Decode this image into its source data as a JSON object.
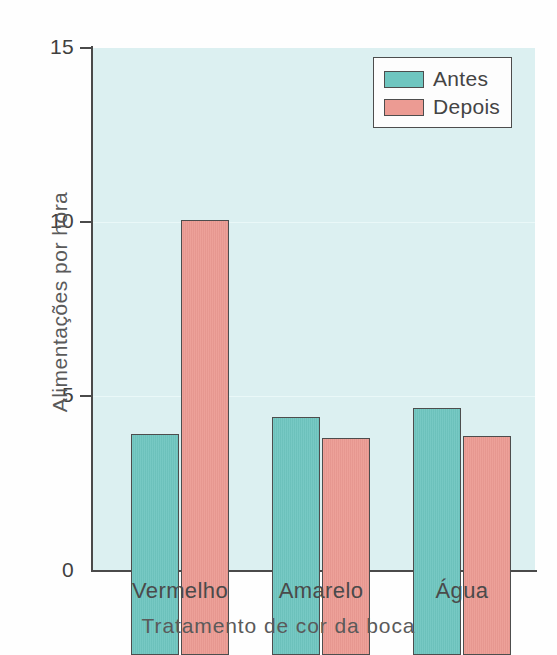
{
  "chart_data": {
    "type": "bar",
    "title": "",
    "xlabel": "Tratamento de cor da boca",
    "ylabel": "Alimentações por hora",
    "categories": [
      "Vermelho",
      "Amarelo",
      "Água"
    ],
    "series": [
      {
        "name": "Antes",
        "color": "#6fc6c0",
        "values": [
          6.35,
          6.85,
          7.1
        ]
      },
      {
        "name": "Depois",
        "color": "#ec9b93",
        "values": [
          12.5,
          6.25,
          6.3
        ]
      }
    ],
    "ylim": [
      0,
      15
    ],
    "yticks": [
      0,
      5,
      10,
      15
    ],
    "ytick_labels": [
      "0",
      "5",
      "10",
      "15"
    ],
    "grid": "faint-horizontal",
    "legend_position": "top-right",
    "plot_background": "#dcf0f1",
    "axis_color": "#4a4a4a"
  },
  "legend": {
    "items": [
      {
        "label": "Antes",
        "color": "#6fc6c0"
      },
      {
        "label": "Depois",
        "color": "#ec9b93"
      }
    ]
  }
}
